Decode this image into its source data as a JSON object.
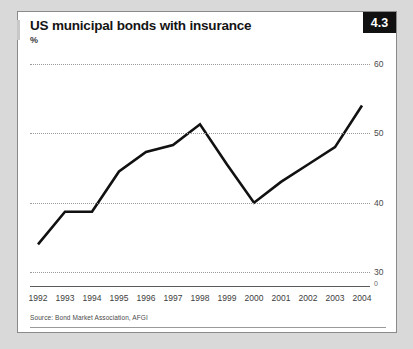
{
  "figure": {
    "badge": "4.3",
    "title": "US municipal bonds with insurance",
    "subtitle": "%",
    "source": "Source: Bond Market Association, AFGI"
  },
  "chart_data": {
    "type": "line",
    "title": "US municipal bonds with insurance",
    "subtitle": "%",
    "xlabel": "",
    "ylabel": "%",
    "categories": [
      "1992",
      "1993",
      "1994",
      "1995",
      "1996",
      "1997",
      "1998",
      "1999",
      "2000",
      "2001",
      "2002",
      "2003",
      "2004"
    ],
    "values": [
      34.0,
      38.7,
      38.7,
      44.5,
      47.3,
      48.3,
      51.3,
      45.5,
      40.0,
      43.0,
      45.5,
      48.0,
      54.0
    ],
    "series": [
      {
        "name": "US municipal bonds with insurance",
        "values": [
          34.0,
          38.7,
          38.7,
          44.5,
          47.3,
          48.3,
          51.3,
          45.5,
          40.0,
          43.0,
          45.5,
          48.0,
          54.0
        ]
      }
    ],
    "ylim": [
      28,
      62
    ],
    "yticks": [
      30,
      40,
      50,
      60
    ],
    "ytick_labels": [
      "30",
      "40",
      "50",
      "60"
    ],
    "zero_label": "0",
    "grid": true,
    "legend": "none",
    "line_color": "#111111",
    "grid_color": "#9a9a9a"
  }
}
